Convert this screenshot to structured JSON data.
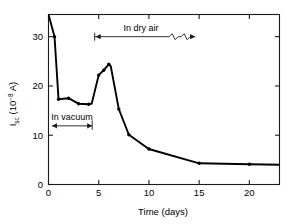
{
  "chart_data": {
    "type": "line",
    "title": "",
    "xlabel": "Time (days)",
    "ylabel": "I_sc (10^-8 A)",
    "ylabel_main": "I",
    "ylabel_sub": "sc",
    "ylabel_paren_open": " (10",
    "ylabel_exp": "−8",
    "ylabel_paren_close": " A)",
    "xlim": [
      0,
      23
    ],
    "ylim": [
      0,
      34.5
    ],
    "xticks": [
      0,
      5,
      10,
      15,
      20
    ],
    "xtick_labels": [
      "0",
      "5",
      "10",
      "15",
      "20"
    ],
    "yticks": [
      0,
      10,
      20,
      30
    ],
    "ytick_labels": [
      "0",
      "10",
      "20",
      "30"
    ],
    "grid": false,
    "legend": "none",
    "series": [
      {
        "name": "Isc",
        "x": [
          0.0,
          0.6,
          1.0,
          2.0,
          3.0,
          4.0,
          4.3,
          5.0,
          5.5,
          6.0,
          6.2,
          7.0,
          8.0,
          10.0,
          15.0,
          20.0,
          23.0
        ],
        "y": [
          34.5,
          30.0,
          17.3,
          17.5,
          16.4,
          16.3,
          16.4,
          22.2,
          23.2,
          24.4,
          24.0,
          15.3,
          10.1,
          7.2,
          4.3,
          4.1,
          4.0
        ]
      }
    ],
    "markers_x": [
      0.6,
      1.0,
      2.0,
      3.0,
      4.0,
      5.0,
      5.5,
      6.0,
      7.0,
      8.0,
      10.0,
      15.0,
      20.0
    ],
    "markers_y": [
      30.0,
      17.3,
      17.5,
      16.4,
      16.3,
      22.2,
      23.2,
      24.4,
      15.3,
      10.1,
      7.2,
      4.3,
      4.1
    ],
    "annotations": [
      {
        "name": "in-dry-air",
        "label": "In dry air",
        "x_start": 4.6,
        "x_end": 14.6,
        "y": 30.0,
        "label_x": 9.2,
        "style": "double-arrow-broken"
      },
      {
        "name": "in-vacuum",
        "label": "In vacuum",
        "x_start": 0.35,
        "x_end": 4.35,
        "y": 11.9,
        "label_x": 2.35,
        "style": "double-arrow"
      }
    ],
    "colors": {
      "line": "#000000",
      "axis": "#1a1a1a",
      "background": "#ffffff"
    }
  }
}
